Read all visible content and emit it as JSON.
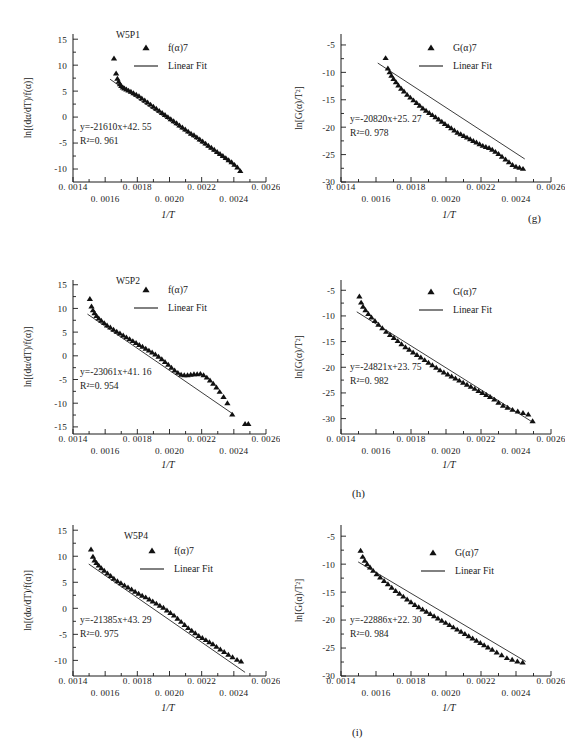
{
  "figure": {
    "panel_letters": [
      "(g)",
      "(h)",
      "(i)"
    ],
    "xlabel": "1/T",
    "ylabel_left": "ln[(dα/dT)/f(α)]",
    "ylabel_right": "ln[G(α)/T²]",
    "xticks": [
      "0. 0014",
      "0. 0016",
      "0. 0018",
      "0. 0020",
      "0. 0022",
      "0. 0024",
      "0. 0026"
    ],
    "xtick_values": [
      0.0014,
      0.0016,
      0.0018,
      0.002,
      0.0022,
      0.0024,
      0.0026
    ],
    "legend_fit": "Linear Fit",
    "legend_marker_left": "f(α)7",
    "legend_marker_right": "G(α)7"
  },
  "chart_data": [
    {
      "id": "g-left",
      "type": "scatter",
      "title": "W5P1",
      "panel": "(g)",
      "xlabel": "1/T",
      "ylabel": "ln[(dα/dT)/f(α)]",
      "xlim": [
        0.0014,
        0.0026
      ],
      "ylim": [
        -12.5,
        16
      ],
      "yticks": [
        "15",
        "10",
        "5",
        "0",
        "-5",
        "-10"
      ],
      "ytick_values": [
        15,
        10,
        5,
        0,
        -5,
        -10
      ],
      "equation": "y=-21610x+42. 55",
      "r2": "R²=0. 961",
      "slope": -21610,
      "intercept": 42.55,
      "r2_value": 0.961,
      "legend": [
        "f(α)7",
        "Linear Fit"
      ],
      "grid": false,
      "legend_position": "top-right",
      "series": [
        {
          "name": "f(α)7",
          "x": [
            0.001655,
            0.001668,
            0.001676,
            0.001684,
            0.001692,
            0.0017,
            0.00171,
            0.00172,
            0.001732,
            0.001745,
            0.00176,
            0.001776,
            0.001793,
            0.00181,
            0.001828,
            0.001846,
            0.001864,
            0.001882,
            0.0019,
            0.001918,
            0.001936,
            0.001954,
            0.001972,
            0.00199,
            0.002008,
            0.002026,
            0.002044,
            0.002062,
            0.00208,
            0.002098,
            0.002116,
            0.002134,
            0.002152,
            0.00217,
            0.002188,
            0.002206,
            0.002224,
            0.002242,
            0.00226,
            0.002278,
            0.002296,
            0.002314,
            0.002332,
            0.00235,
            0.002368,
            0.002386,
            0.002404,
            0.002422,
            0.00244
          ],
          "y": [
            11.3,
            8.4,
            7.4,
            6.8,
            6.3,
            6.0,
            5.7,
            5.5,
            5.3,
            5.1,
            4.9,
            4.6,
            4.3,
            4.0,
            3.6,
            3.2,
            2.8,
            2.4,
            2.0,
            1.6,
            1.2,
            0.8,
            0.4,
            0.0,
            -0.4,
            -0.8,
            -1.2,
            -1.6,
            -2.0,
            -2.4,
            -2.8,
            -3.2,
            -3.5,
            -3.9,
            -4.3,
            -4.7,
            -5.1,
            -5.5,
            -5.9,
            -6.3,
            -6.7,
            -7.1,
            -7.5,
            -7.9,
            -8.3,
            -8.7,
            -9.2,
            -9.7,
            -10.4
          ]
        }
      ],
      "fit_x": [
        0.00163,
        0.00245
      ],
      "fit_y": [
        7.3,
        -10.4
      ]
    },
    {
      "id": "g-right",
      "type": "scatter",
      "title": "",
      "panel": "(g)",
      "xlabel": "1/T",
      "ylabel": "ln[G(α)/T²]",
      "xlim": [
        0.0014,
        0.0026
      ],
      "ylim": [
        -30,
        -3
      ],
      "yticks": [
        "-5",
        "-10",
        "-15",
        "-20",
        "-25",
        "-30"
      ],
      "ytick_values": [
        -5,
        -10,
        -15,
        -20,
        -25,
        -30
      ],
      "equation": "y=-20820x+25. 27",
      "r2": "R²=0. 978",
      "slope": -20820,
      "intercept": 25.27,
      "r2_value": 0.978,
      "legend": [
        "G(α)7",
        "Linear Fit"
      ],
      "grid": false,
      "legend_position": "top-right",
      "series": [
        {
          "name": "G(α)7",
          "x": [
            0.001655,
            0.001668,
            0.001678,
            0.001688,
            0.0017,
            0.001714,
            0.001728,
            0.001744,
            0.00176,
            0.001778,
            0.001796,
            0.001814,
            0.001832,
            0.00185,
            0.001868,
            0.001886,
            0.001904,
            0.001922,
            0.00194,
            0.001958,
            0.001976,
            0.001994,
            0.002012,
            0.00203,
            0.002048,
            0.002066,
            0.002084,
            0.002102,
            0.00212,
            0.002138,
            0.002156,
            0.002174,
            0.002192,
            0.00221,
            0.002228,
            0.002246,
            0.002264,
            0.002282,
            0.0023,
            0.00232,
            0.00234,
            0.00236,
            0.00238,
            0.0024,
            0.00242,
            0.00244
          ],
          "y": [
            -7.4,
            -9.3,
            -10.0,
            -10.6,
            -11.2,
            -11.8,
            -12.4,
            -13.0,
            -13.5,
            -14.1,
            -14.6,
            -15.1,
            -15.6,
            -16.1,
            -16.6,
            -17.0,
            -17.4,
            -17.8,
            -18.2,
            -18.6,
            -19.0,
            -19.4,
            -19.8,
            -20.2,
            -20.6,
            -21.0,
            -21.3,
            -21.6,
            -21.9,
            -22.2,
            -22.5,
            -22.8,
            -23.1,
            -23.4,
            -23.6,
            -23.8,
            -24.1,
            -24.5,
            -24.9,
            -25.4,
            -25.9,
            -26.4,
            -26.9,
            -27.2,
            -27.4,
            -27.6
          ]
        }
      ],
      "fit_x": [
        0.00161,
        0.00245
      ],
      "fit_y": [
        -8.3,
        -25.8
      ]
    },
    {
      "id": "h-left",
      "type": "scatter",
      "title": "W5P2",
      "panel": "(h)",
      "xlabel": "1/T",
      "ylabel": "ln[(dα/dT)/f(α)]",
      "xlim": [
        0.0014,
        0.0026
      ],
      "ylim": [
        -16.5,
        16
      ],
      "yticks": [
        "15",
        "10",
        "5",
        "0",
        "-5",
        "-10",
        "-15"
      ],
      "ytick_values": [
        15,
        10,
        5,
        0,
        -5,
        -10,
        -15
      ],
      "equation": "y=-23061x+41. 16",
      "r2": "R²=0. 954",
      "slope": -23061,
      "intercept": 41.16,
      "r2_value": 0.954,
      "legend": [
        "f(α)7",
        "Linear Fit"
      ],
      "grid": false,
      "legend_position": "top-right",
      "series": [
        {
          "name": "f(α)7",
          "x": [
            0.001505,
            0.001515,
            0.001524,
            0.001534,
            0.001546,
            0.00156,
            0.001576,
            0.001594,
            0.001612,
            0.001632,
            0.001652,
            0.001672,
            0.001692,
            0.001712,
            0.001732,
            0.001752,
            0.001772,
            0.001792,
            0.001812,
            0.001832,
            0.001852,
            0.001872,
            0.001892,
            0.001912,
            0.001932,
            0.001952,
            0.001972,
            0.001992,
            0.002012,
            0.002032,
            0.002052,
            0.002072,
            0.002092,
            0.002112,
            0.002132,
            0.002152,
            0.002172,
            0.002192,
            0.002212,
            0.002232,
            0.002252,
            0.002272,
            0.002292,
            0.002312,
            0.002336,
            0.00236,
            0.00239,
            0.00247,
            0.00249
          ],
          "y": [
            12.0,
            10.4,
            9.6,
            9.0,
            8.4,
            7.9,
            7.4,
            6.9,
            6.4,
            6.0,
            5.5,
            5.1,
            4.7,
            4.3,
            3.9,
            3.5,
            3.1,
            2.7,
            2.3,
            1.9,
            1.5,
            1.1,
            0.7,
            0.3,
            -0.2,
            -0.7,
            -1.3,
            -1.9,
            -2.5,
            -3.1,
            -3.6,
            -4.0,
            -4.1,
            -4.1,
            -4.0,
            -3.9,
            -3.9,
            -3.8,
            -4.1,
            -4.6,
            -5.2,
            -5.9,
            -6.7,
            -7.6,
            -8.7,
            -10.0,
            -12.4,
            -14.4,
            -14.4
          ]
        }
      ],
      "fit_x": [
        0.00149,
        0.0024
      ],
      "fit_y": [
        8.8,
        -12.4
      ]
    },
    {
      "id": "h-right",
      "type": "scatter",
      "title": "",
      "panel": "(h)",
      "xlabel": "1/T",
      "ylabel": "ln[G(α)/T²]",
      "xlim": [
        0.0014,
        0.0026
      ],
      "ylim": [
        -33,
        -3
      ],
      "yticks": [
        "-5",
        "-10",
        "-15",
        "-20",
        "-25",
        "-30"
      ],
      "ytick_values": [
        -5,
        -10,
        -15,
        -20,
        -25,
        -30
      ],
      "equation": "y=-24821x+23. 75",
      "r2": "R²=0. 982",
      "slope": -24821,
      "intercept": 23.75,
      "r2_value": 0.982,
      "legend": [
        "G(α)7",
        "Linear Fit"
      ],
      "grid": false,
      "legend_position": "top-right",
      "series": [
        {
          "name": "G(α)7",
          "x": [
            0.001505,
            0.001515,
            0.001526,
            0.00154,
            0.001556,
            0.001574,
            0.001594,
            0.001614,
            0.001636,
            0.001658,
            0.00168,
            0.001702,
            0.001724,
            0.001746,
            0.001768,
            0.00179,
            0.001812,
            0.001834,
            0.001856,
            0.001878,
            0.0019,
            0.001922,
            0.001944,
            0.001966,
            0.001988,
            0.00201,
            0.002032,
            0.002054,
            0.002076,
            0.002098,
            0.00212,
            0.002142,
            0.002164,
            0.002186,
            0.002208,
            0.00223,
            0.002252,
            0.002276,
            0.0023,
            0.002326,
            0.002352,
            0.00238,
            0.00241,
            0.00244,
            0.00247,
            0.002495
          ],
          "y": [
            -6.2,
            -7.4,
            -8.2,
            -8.9,
            -9.6,
            -10.3,
            -11.0,
            -11.7,
            -12.4,
            -13.1,
            -13.7,
            -14.3,
            -14.9,
            -15.5,
            -16.1,
            -16.6,
            -17.1,
            -17.6,
            -18.1,
            -18.6,
            -19.1,
            -19.6,
            -20.1,
            -20.6,
            -21.0,
            -21.4,
            -21.8,
            -22.2,
            -22.6,
            -23.0,
            -23.4,
            -23.8,
            -24.2,
            -24.6,
            -25.0,
            -25.4,
            -25.8,
            -26.3,
            -26.9,
            -27.5,
            -27.9,
            -28.3,
            -28.6,
            -28.9,
            -29.2,
            -30.5
          ]
        }
      ],
      "fit_x": [
        0.00149,
        0.0025
      ],
      "fit_y": [
        -9.2,
        -30.8
      ]
    },
    {
      "id": "i-left",
      "type": "scatter",
      "title": "W5P4",
      "panel": "(i)",
      "xlabel": "1/T",
      "ylabel": "ln[(dα/dT)/f(α)]",
      "xlim": [
        0.0014,
        0.0026
      ],
      "ylim": [
        -13,
        16
      ],
      "yticks": [
        "15",
        "10",
        "5",
        "0",
        "-5",
        "-10"
      ],
      "ytick_values": [
        15,
        10,
        5,
        0,
        -5,
        -10
      ],
      "equation": "y=-21385x+43. 29",
      "r2": "R²=0. 975",
      "slope": -21385,
      "intercept": 43.29,
      "r2_value": 0.975,
      "legend": [
        "f(α)7",
        "Linear Fit"
      ],
      "grid": false,
      "legend_position": "top-right",
      "series": [
        {
          "name": "f(α)7",
          "x": [
            0.001512,
            0.001524,
            0.001534,
            0.001546,
            0.00156,
            0.001576,
            0.001594,
            0.001614,
            0.001634,
            0.001654,
            0.001676,
            0.001698,
            0.00172,
            0.001742,
            0.001764,
            0.001786,
            0.001808,
            0.00183,
            0.001852,
            0.001874,
            0.001896,
            0.001918,
            0.00194,
            0.001962,
            0.001984,
            0.002006,
            0.002028,
            0.00205,
            0.002072,
            0.002094,
            0.002116,
            0.002138,
            0.00216,
            0.002182,
            0.002204,
            0.002226,
            0.002248,
            0.00227,
            0.002292,
            0.002316,
            0.00234,
            0.002366,
            0.002392,
            0.00242,
            0.002445
          ],
          "y": [
            11.3,
            9.9,
            9.2,
            8.7,
            8.2,
            7.7,
            7.2,
            6.7,
            6.2,
            5.7,
            5.2,
            4.8,
            4.4,
            4.0,
            3.6,
            3.2,
            2.8,
            2.4,
            2.1,
            1.7,
            1.3,
            0.9,
            0.5,
            0.1,
            -0.4,
            -0.9,
            -1.4,
            -2.0,
            -2.6,
            -3.2,
            -3.8,
            -4.3,
            -4.8,
            -5.3,
            -5.7,
            -6.1,
            -6.5,
            -6.9,
            -7.4,
            -7.9,
            -8.4,
            -8.9,
            -9.4,
            -9.9,
            -10.2
          ]
        }
      ],
      "fit_x": [
        0.001498,
        0.00247
      ],
      "fit_y": [
        8.5,
        -12.3
      ]
    },
    {
      "id": "i-right",
      "type": "scatter",
      "title": "",
      "panel": "(i)",
      "xlabel": "1/T",
      "ylabel": "ln[G(α)/T²]",
      "xlim": [
        0.0014,
        0.0026
      ],
      "ylim": [
        -30,
        -3
      ],
      "yticks": [
        "-5",
        "-10",
        "-15",
        "-20",
        "-25",
        "-30"
      ],
      "ytick_values": [
        -5,
        -10,
        -15,
        -20,
        -25,
        -30
      ],
      "equation": "y=-22886x+22. 30",
      "r2": "R²=0. 984",
      "slope": -22886,
      "intercept": 22.3,
      "r2_value": 0.984,
      "legend": [
        "G(α)7",
        "Linear Fit"
      ],
      "grid": false,
      "legend_position": "top-right",
      "series": [
        {
          "name": "G(α)7",
          "x": [
            0.001512,
            0.001524,
            0.001536,
            0.00155,
            0.001566,
            0.001584,
            0.001604,
            0.001624,
            0.001646,
            0.001668,
            0.00169,
            0.001712,
            0.001734,
            0.001756,
            0.001778,
            0.0018,
            0.001822,
            0.001844,
            0.001866,
            0.001888,
            0.00191,
            0.001932,
            0.001954,
            0.001976,
            0.001998,
            0.00202,
            0.002042,
            0.002064,
            0.002086,
            0.002108,
            0.00213,
            0.002152,
            0.002174,
            0.002196,
            0.002218,
            0.00224,
            0.002264,
            0.00229,
            0.002318,
            0.002348,
            0.002378,
            0.002408,
            0.002438
          ],
          "y": [
            -7.6,
            -8.7,
            -9.4,
            -10.0,
            -10.6,
            -11.2,
            -11.8,
            -12.4,
            -13.0,
            -13.6,
            -14.2,
            -14.8,
            -15.3,
            -15.8,
            -16.3,
            -16.8,
            -17.3,
            -17.7,
            -18.1,
            -18.5,
            -18.9,
            -19.3,
            -19.7,
            -20.1,
            -20.5,
            -20.9,
            -21.3,
            -21.7,
            -22.1,
            -22.5,
            -22.9,
            -23.3,
            -23.7,
            -24.1,
            -24.5,
            -24.9,
            -25.3,
            -25.8,
            -26.3,
            -26.8,
            -27.1,
            -27.4,
            -27.6
          ]
        }
      ],
      "fit_x": [
        0.001498,
        0.002455
      ],
      "fit_y": [
        -9.6,
        -27.4
      ]
    }
  ]
}
